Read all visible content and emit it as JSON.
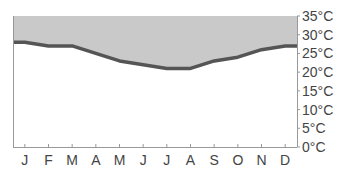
{
  "chart_data": {
    "type": "area",
    "title": "",
    "xlabel": "",
    "ylabel": "",
    "categories": [
      "J",
      "F",
      "M",
      "A",
      "M",
      "J",
      "J",
      "A",
      "S",
      "O",
      "N",
      "D"
    ],
    "series": [
      {
        "name": "Temperature",
        "values": [
          28,
          27,
          27,
          25,
          23,
          22,
          21,
          21,
          23,
          24,
          26,
          27
        ]
      }
    ],
    "fill": "above-line",
    "ylim": [
      0,
      35
    ],
    "yticks": [
      0,
      5,
      10,
      15,
      20,
      25,
      30,
      35
    ],
    "ytick_labels": [
      "0°C",
      "5°C",
      "10°C",
      "15°C",
      "20°C",
      "25°C",
      "30°C",
      "35°C"
    ],
    "yaxis_position": "right",
    "grid": false,
    "colors": {
      "fill": "#c9c9c9",
      "line": "#555555",
      "axis": "#999999",
      "text": "#444444"
    }
  }
}
